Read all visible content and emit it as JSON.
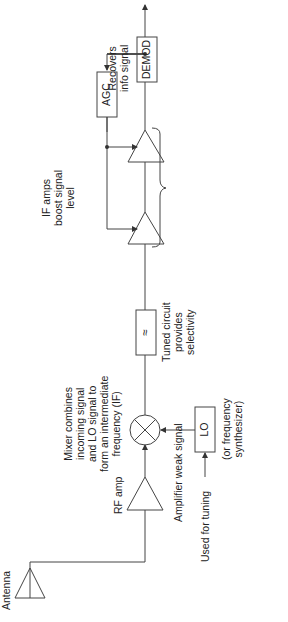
{
  "diagram": {
    "orientation": "rotated 90 degrees counter-clockwise",
    "colors": {
      "line": "#333333",
      "background": "#ffffff",
      "text": "#222222"
    },
    "blocks": {
      "antenna": {
        "label": "Antenna"
      },
      "rf_amp": {
        "label": "RF amp",
        "note": "Amplifier weak signal"
      },
      "mixer": {
        "symbol": "circle-x",
        "note_lines": [
          "Mixer combines",
          "incoming signal",
          "and LO signal to",
          "form an intermediate",
          "frequency (IF)"
        ]
      },
      "lo": {
        "label": "LO",
        "note_lines": [
          "(or frequency",
          "synthesizer)"
        ],
        "input_note": "Used for tuning"
      },
      "tuned_circuit": {
        "symbol": "≈",
        "note_lines": [
          "Tuned circuit",
          "provides",
          "selectivity"
        ]
      },
      "if_amps": {
        "count": 2,
        "note_lines": [
          "IF amps",
          "boost signal",
          "level"
        ]
      },
      "agc": {
        "label": "AGC",
        "note_lines": [
          "Automatic gain",
          "control sets",
          "gain of IF amps",
          "based on signal",
          "strength"
        ]
      },
      "demod": {
        "label": "DEMOD",
        "note_lines": [
          "Recovers",
          "info signal"
        ]
      }
    }
  }
}
